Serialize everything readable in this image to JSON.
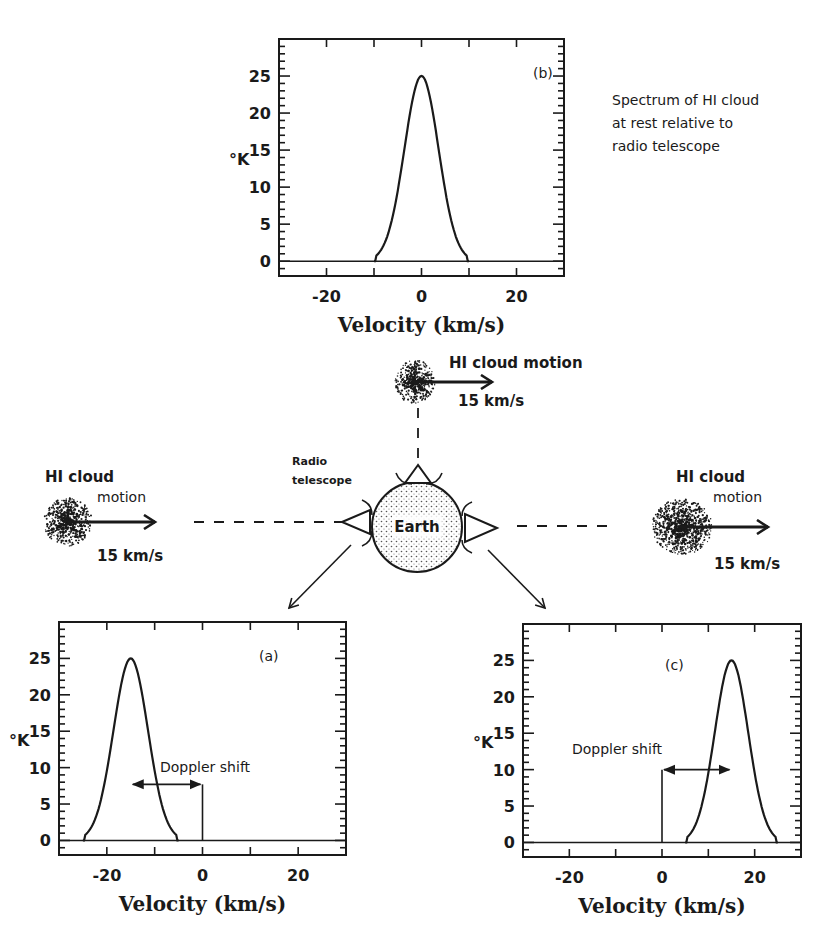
{
  "figure": {
    "description_note": "Spectrum of HI cloud at rest relative to radio telescope",
    "note_lines": [
      "Spectrum of HI cloud",
      "at rest relative to",
      "radio telescope"
    ],
    "earth_label": "Earth",
    "radio_telescope_label_lines": [
      "Radio",
      "telescope"
    ],
    "top_cloud": {
      "label": "HI cloud motion",
      "speed": "15 km/s"
    },
    "left_cloud": {
      "label_line1": "HI cloud",
      "label_line2": "motion",
      "speed": "15 km/s"
    },
    "right_cloud": {
      "label_line1": "HI cloud",
      "label_line2": "motion",
      "speed": "15 km/s"
    },
    "doppler_label": "Doppler shift",
    "colors": {
      "ink": "#1a1a1a",
      "background": "#ffffff",
      "earth_fill": "#e8e8e8"
    }
  },
  "chart_data": [
    {
      "id": "b",
      "type": "line",
      "panel_label": "(b)",
      "title": "",
      "xlabel": "Velocity (km/s)",
      "ylabel": "°K",
      "xlim": [
        -30,
        30
      ],
      "ylim": [
        -2,
        30
      ],
      "xticks": [
        -20,
        0,
        20
      ],
      "yticks": [
        0,
        5,
        10,
        15,
        20,
        25
      ],
      "grid": false,
      "series": [
        {
          "name": "HI spectrum (at rest)",
          "shape": "gaussian",
          "center": 0,
          "peak": 25,
          "sigma": 3.6,
          "x": [
            -10,
            -8,
            -6,
            -4,
            -2,
            0,
            2,
            4,
            6,
            8,
            10
          ],
          "y": [
            0,
            2,
            6.2,
            13.5,
            21.3,
            25,
            21.3,
            13.5,
            6.2,
            2,
            0
          ]
        }
      ],
      "annotations": []
    },
    {
      "id": "a",
      "type": "line",
      "panel_label": "(a)",
      "title": "",
      "xlabel": "Velocity (km/s)",
      "ylabel": "°K",
      "xlim": [
        -30,
        30
      ],
      "ylim": [
        -2,
        30
      ],
      "xticks": [
        -20,
        0,
        20
      ],
      "yticks": [
        0,
        5,
        10,
        15,
        20,
        25
      ],
      "grid": false,
      "series": [
        {
          "name": "HI spectrum (approaching)",
          "shape": "gaussian",
          "center": -15,
          "peak": 25,
          "sigma": 3.6,
          "x": [
            -25,
            -23,
            -21,
            -19,
            -17,
            -15,
            -13,
            -11,
            -9,
            -7,
            -5
          ],
          "y": [
            0,
            2,
            6.2,
            13.5,
            21.3,
            25,
            21.3,
            13.5,
            6.2,
            2,
            0
          ]
        }
      ],
      "annotations": [
        {
          "type": "double-arrow",
          "text": "Doppler shift",
          "x_from": -15,
          "x_to": 0,
          "y": 7.7
        },
        {
          "type": "vline",
          "x": 0,
          "y_from": 0,
          "y_to": 7.7
        }
      ]
    },
    {
      "id": "c",
      "type": "line",
      "panel_label": "(c)",
      "title": "",
      "xlabel": "Velocity (km/s)",
      "ylabel": "°K",
      "xlim": [
        -30,
        30
      ],
      "ylim": [
        -2,
        30
      ],
      "xticks": [
        -20,
        0,
        20
      ],
      "yticks": [
        0,
        5,
        10,
        15,
        20,
        25
      ],
      "grid": false,
      "series": [
        {
          "name": "HI spectrum (receding)",
          "shape": "gaussian",
          "center": 15,
          "peak": 25,
          "sigma": 3.6,
          "x": [
            5,
            7,
            9,
            11,
            13,
            15,
            17,
            19,
            21,
            23,
            25
          ],
          "y": [
            0,
            2,
            6.2,
            13.5,
            21.3,
            25,
            21.3,
            13.5,
            6.2,
            2,
            0
          ]
        }
      ],
      "annotations": [
        {
          "type": "double-arrow",
          "text": "Doppler shift",
          "x_from": 0,
          "x_to": 15,
          "y": 10
        },
        {
          "type": "vline",
          "x": 0,
          "y_from": 0,
          "y_to": 10
        }
      ]
    }
  ],
  "panels_layout": {
    "b": {
      "left": 279,
      "top": 39,
      "right": 564,
      "bottom": 276,
      "label_pos": [
        533,
        78
      ],
      "doppler_label_pos": null
    },
    "a": {
      "left": 59,
      "top": 622,
      "right": 346,
      "bottom": 855,
      "label_pos": [
        259,
        661
      ],
      "doppler_label_pos": [
        160,
        772
      ]
    },
    "c": {
      "left": 523,
      "top": 624,
      "right": 801,
      "bottom": 857,
      "label_pos": [
        665,
        670
      ],
      "doppler_label_pos": [
        572,
        754
      ]
    }
  }
}
